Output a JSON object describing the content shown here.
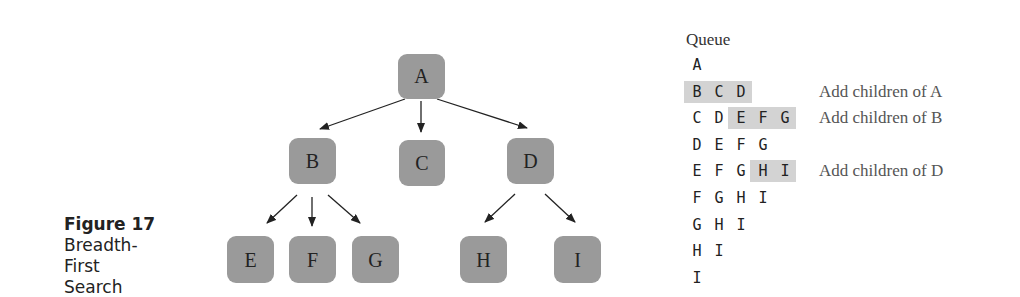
{
  "figure": {
    "number": "Figure 17",
    "title": "Breadth-First Search"
  },
  "colors": {
    "node_fill": "#9a9a9a",
    "highlight": "#d3d3d3",
    "arrow": "#222222"
  },
  "tree": {
    "nodes": [
      {
        "id": "A",
        "label": "A"
      },
      {
        "id": "B",
        "label": "B"
      },
      {
        "id": "C",
        "label": "C"
      },
      {
        "id": "D",
        "label": "D"
      },
      {
        "id": "E",
        "label": "E"
      },
      {
        "id": "F",
        "label": "F"
      },
      {
        "id": "G",
        "label": "G"
      },
      {
        "id": "H",
        "label": "H"
      },
      {
        "id": "I",
        "label": "I"
      }
    ],
    "edges": [
      [
        "A",
        "B"
      ],
      [
        "A",
        "C"
      ],
      [
        "A",
        "D"
      ],
      [
        "B",
        "E"
      ],
      [
        "B",
        "F"
      ],
      [
        "B",
        "G"
      ],
      [
        "D",
        "H"
      ],
      [
        "D",
        "I"
      ]
    ]
  },
  "queue": {
    "title": "Queue",
    "rows": [
      {
        "items": [
          "A"
        ],
        "highlight": [],
        "note": ""
      },
      {
        "items": [
          "B",
          "C",
          "D"
        ],
        "highlight": [
          0,
          2
        ],
        "note": "Add children of A"
      },
      {
        "items": [
          "C",
          "D",
          "E",
          "F",
          "G"
        ],
        "highlight": [
          2,
          4
        ],
        "note": "Add children of B"
      },
      {
        "items": [
          "D",
          "E",
          "F",
          "G"
        ],
        "highlight": [],
        "note": ""
      },
      {
        "items": [
          "E",
          "F",
          "G",
          "H",
          "I"
        ],
        "highlight": [
          3,
          4
        ],
        "note": "Add children of D"
      },
      {
        "items": [
          "F",
          "G",
          "H",
          "I"
        ],
        "highlight": [],
        "note": ""
      },
      {
        "items": [
          "G",
          "H",
          "I"
        ],
        "highlight": [],
        "note": ""
      },
      {
        "items": [
          "H",
          "I"
        ],
        "highlight": [],
        "note": ""
      },
      {
        "items": [
          "I"
        ],
        "highlight": [],
        "note": ""
      }
    ]
  }
}
